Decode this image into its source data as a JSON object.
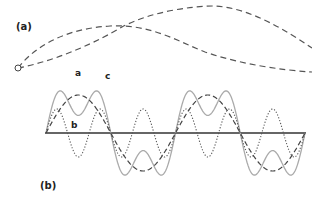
{
  "figure": {
    "panel_a": {
      "label": "(a)",
      "curve_color": "#555555"
    },
    "panel_b": {
      "label": "(b)",
      "curves": [
        {
          "label": "a",
          "description": "sum of c and b",
          "style": "solid",
          "color": "#aaaaaa"
        },
        {
          "label": "b",
          "description": "third harmonic",
          "style": "dotted",
          "color": "#555555"
        },
        {
          "label": "c",
          "description": "fundamental",
          "style": "dashed",
          "color": "#444444"
        }
      ],
      "axis_color": "#333333"
    }
  }
}
